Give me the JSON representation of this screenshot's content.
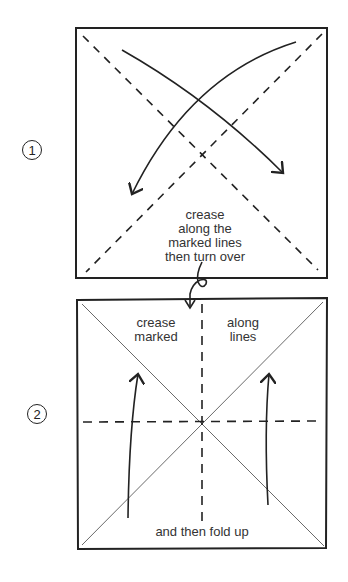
{
  "steps": [
    {
      "number": "1",
      "instruction_lines": [
        "crease",
        "along the",
        "marked lines",
        "then turn over"
      ]
    },
    {
      "number": "2",
      "labels": {
        "top_left": [
          "crease",
          "marked"
        ],
        "top_right": [
          "along",
          "lines"
        ],
        "bottom": "and then fold up"
      }
    }
  ],
  "colors": {
    "ink": "#222222",
    "paper": "#ffffff"
  }
}
